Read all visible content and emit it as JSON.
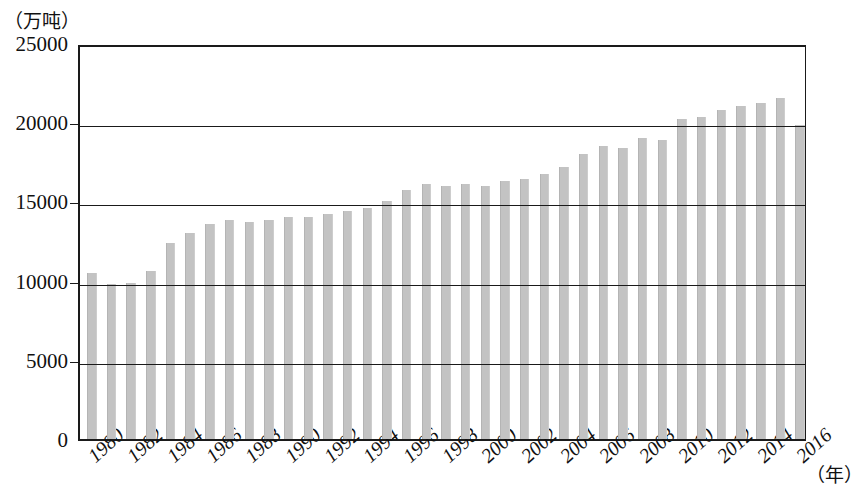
{
  "chart_data": {
    "type": "bar",
    "title": "",
    "subtitle": "",
    "ylabel": "（万吨）",
    "xlabel": "（年）",
    "ylim": [
      0,
      25000
    ],
    "ytick_labels": [
      "0",
      "5000",
      "10000",
      "15000",
      "20000",
      "25000"
    ],
    "ytick_values": [
      0,
      5000,
      10000,
      15000,
      20000,
      25000
    ],
    "grid": true,
    "legend": "none",
    "xtick_labels": [
      "1980",
      "1982",
      "1984",
      "1986",
      "1988",
      "1990",
      "1992",
      "1994",
      "1996",
      "1998",
      "2000",
      "2002",
      "2004",
      "2006",
      "2008",
      "2010",
      "2012",
      "2014",
      "2016"
    ],
    "categories": [
      "1980",
      "1981",
      "1982",
      "1983",
      "1984",
      "1985",
      "1986",
      "1987",
      "1988",
      "1989",
      "1990",
      "1991",
      "1992",
      "1993",
      "1994",
      "1995",
      "1996",
      "1997",
      "1998",
      "1999",
      "2000",
      "2001",
      "2002",
      "2003",
      "2004",
      "2005",
      "2006",
      "2007",
      "2008",
      "2009",
      "2010",
      "2011",
      "2012",
      "2013",
      "2014",
      "2015",
      "2016"
    ],
    "values": [
      10500,
      9800,
      9850,
      10600,
      12400,
      13000,
      13600,
      13800,
      13700,
      13800,
      14000,
      14000,
      14200,
      14400,
      14600,
      15000,
      15700,
      16100,
      16000,
      16100,
      16000,
      16300,
      16400,
      16700,
      17200,
      18000,
      18500,
      18400,
      19000,
      18900,
      20200,
      20300,
      20800,
      21000,
      21200,
      21500,
      19800
    ],
    "bar_color": "#c3c3c3",
    "axis_color": "#1a1a1a"
  }
}
